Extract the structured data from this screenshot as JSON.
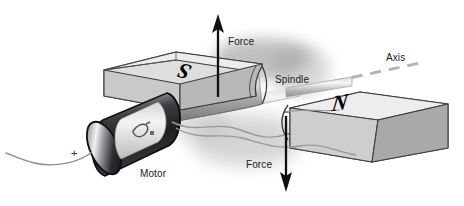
{
  "figure": {
    "background_color": "#ffffff",
    "width": 464,
    "height": 206
  },
  "labels": {
    "force_top": "Force",
    "force_bottom": "Force",
    "spindle": "Spindle",
    "axis": "Axis",
    "motor": "Motor",
    "positive_terminal": "+"
  },
  "poles": {
    "south": "S",
    "north": "N"
  },
  "colors": {
    "ink": "#1a1a1a",
    "magnet_top": "#e8e8e8",
    "magnet_side": "#a8a8a8",
    "magnet_front": "#c4c4c4",
    "magnet_outline": "#3a3a3a",
    "motor_body_dark": "#2b2b2b",
    "motor_body_mid": "#6d6d6d",
    "motor_label_band": "#e2e2e2",
    "spindle_gray": "#b5b5b5",
    "wire_gray": "#8f8f8f",
    "axis_dash": "#b0b0b0",
    "arrow_black": "#111111",
    "shadow_gray": "#9a9a9a"
  },
  "elements": {
    "upper_magnet": "south-pole magnet slab, upper left, labelled S",
    "lower_magnet": "north-pole magnet slab, lower right, labelled N",
    "spindle": "horizontal rotating shaft passing between the magnet poles",
    "axis_line": "dashed centre line marking the rotation axis",
    "motor": "cylindrical electric motor at lower left driving the spindle",
    "force_arrow_up": "black arrow pointing up from the spindle",
    "force_arrow_down": "black arrow pointing down from the spindle",
    "lead_wire": "thin curved wire leaving the motor to the left at the + terminal"
  }
}
